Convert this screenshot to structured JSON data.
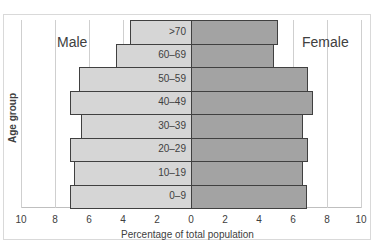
{
  "chart_data": {
    "type": "bar",
    "subtype": "population-pyramid",
    "title": "",
    "xlabel": "Percentage of total population",
    "ylabel": "Age group",
    "xlim": [
      -10,
      10
    ],
    "x_ticks": [
      "10",
      "8",
      "6",
      "4",
      "2",
      "0",
      "2",
      "4",
      "6",
      "8",
      "10"
    ],
    "grid": true,
    "categories": [
      ">70",
      "60–69",
      "50–59",
      "40–49",
      "30–39",
      "20–29",
      "10–19",
      "0–9"
    ],
    "series": [
      {
        "name": "Male",
        "side": "left",
        "color": "#d6d6d6",
        "values": [
          3.6,
          4.4,
          6.6,
          7.1,
          6.5,
          7.1,
          6.9,
          7.1
        ]
      },
      {
        "name": "Female",
        "side": "right",
        "color": "#a3a3a3",
        "values": [
          5.1,
          4.9,
          6.9,
          7.2,
          6.6,
          6.9,
          6.6,
          6.8
        ]
      }
    ],
    "legend": "inline labels (Male top-left, Female top-right)"
  },
  "labels": {
    "male": "Male",
    "female": "Female",
    "xlabel": "Percentage of total population",
    "ylabel": "Age group"
  }
}
